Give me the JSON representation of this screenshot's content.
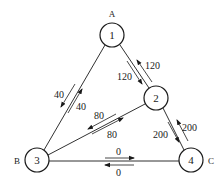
{
  "diagram": {
    "type": "network-graph",
    "nodes": [
      {
        "id": "1",
        "label": "1",
        "name": "A",
        "x": 112,
        "y": 35
      },
      {
        "id": "2",
        "label": "2",
        "name": "",
        "x": 156,
        "y": 98
      },
      {
        "id": "3",
        "label": "3",
        "name": "B",
        "x": 37,
        "y": 160
      },
      {
        "id": "4",
        "label": "4",
        "name": "C",
        "x": 191,
        "y": 160
      }
    ],
    "node_radius": 12,
    "edges": [
      {
        "from": "1",
        "to": "3",
        "flows": [
          {
            "dir": "1->3",
            "value": "40"
          },
          {
            "dir": "3->1",
            "value": "40"
          }
        ]
      },
      {
        "from": "1",
        "to": "2",
        "flows": [
          {
            "dir": "1->2",
            "value": "120"
          },
          {
            "dir": "2->1",
            "value": "120"
          }
        ]
      },
      {
        "from": "2",
        "to": "3",
        "flows": [
          {
            "dir": "2->3",
            "value": "80"
          },
          {
            "dir": "3->2",
            "value": "80"
          }
        ]
      },
      {
        "from": "2",
        "to": "4",
        "flows": [
          {
            "dir": "2->4",
            "value": "200"
          },
          {
            "dir": "4->2",
            "value": "200"
          }
        ]
      },
      {
        "from": "3",
        "to": "4",
        "flows": [
          {
            "dir": "3->4",
            "value": "0"
          },
          {
            "dir": "4->3",
            "value": "0"
          }
        ]
      }
    ],
    "labels": {
      "node_A": "A",
      "node_B": "B",
      "node_C": "C",
      "n1": "1",
      "n2": "2",
      "n3": "3",
      "n4": "4",
      "e13_a": "40",
      "e13_b": "40",
      "e12_a": "120",
      "e12_b": "120",
      "e23_a": "80",
      "e23_b": "80",
      "e24_a": "200",
      "e24_b": "200",
      "e34_a": "0",
      "e34_b": "0"
    },
    "colors": {
      "stroke": "#1a1a1a",
      "background": "#ffffff"
    }
  }
}
